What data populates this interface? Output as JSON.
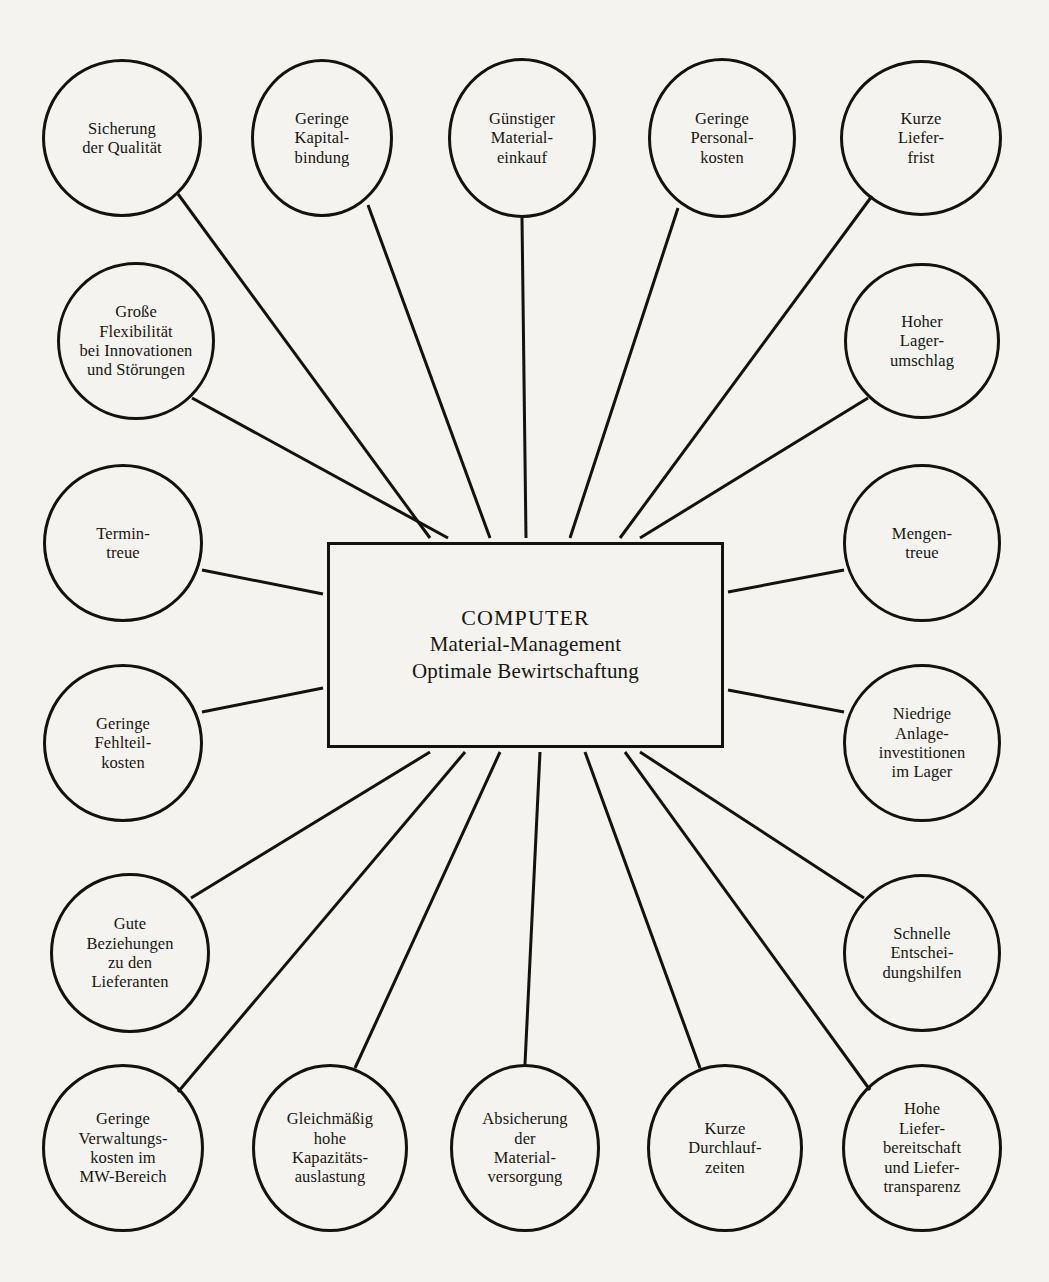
{
  "diagram": {
    "background_color": "#f4f3ef",
    "line_color": "#14120c",
    "center": {
      "title": "COMPUTER",
      "line2": "Material-Management",
      "line3": "Optimale Bewirtschaftung",
      "box": {
        "x": 327,
        "y": 542,
        "width": 397,
        "height": 206
      }
    },
    "nodes": [
      {
        "id": "sicherung-der-qualitaet",
        "label": "Sicherung\nder Qualität",
        "cx": 122,
        "cy": 138,
        "rx": 80,
        "ry": 79
      },
      {
        "id": "geringe-kapitalbindung",
        "label": "Geringe\nKapital-\nbindung",
        "cx": 322,
        "cy": 138,
        "rx": 71,
        "ry": 79
      },
      {
        "id": "guenstiger-materialeinkauf",
        "label": "Günstiger\nMaterial-\neinkauf",
        "cx": 522,
        "cy": 138,
        "rx": 74,
        "ry": 80
      },
      {
        "id": "geringe-personalkosten",
        "label": "Geringe\nPersonal-\nkosten",
        "cx": 722,
        "cy": 138,
        "rx": 74,
        "ry": 80
      },
      {
        "id": "kurze-lieferfrist",
        "label": "Kurze\nLiefer-\nfrist",
        "cx": 921,
        "cy": 138,
        "rx": 81,
        "ry": 78
      },
      {
        "id": "grosse-flexibilitaet",
        "label": "Große\nFlexibilität\nbei Innovationen\nund Störungen",
        "cx": 136,
        "cy": 341,
        "rx": 79,
        "ry": 79
      },
      {
        "id": "hoher-lagerumschlag",
        "label": "Hoher\nLager-\numschlag",
        "cx": 922,
        "cy": 341,
        "rx": 78,
        "ry": 78
      },
      {
        "id": "termintreue",
        "label": "Termin-\ntreue",
        "cx": 123,
        "cy": 543,
        "rx": 80,
        "ry": 79
      },
      {
        "id": "mengentreue",
        "label": "Mengen-\ntreue",
        "cx": 922,
        "cy": 543,
        "rx": 79,
        "ry": 79
      },
      {
        "id": "geringe-fehlteilkosten",
        "label": "Geringe\nFehlteil-\nkosten",
        "cx": 123,
        "cy": 743,
        "rx": 80,
        "ry": 79
      },
      {
        "id": "niedrige-anlageinvest",
        "label": "Niedrige\nAnlage-\ninvestitionen\nim Lager",
        "cx": 922,
        "cy": 743,
        "rx": 79,
        "ry": 79
      },
      {
        "id": "gute-beziehungen",
        "label": "Gute\nBeziehungen\nzu den\nLieferanten",
        "cx": 130,
        "cy": 953,
        "rx": 80,
        "ry": 80
      },
      {
        "id": "schnelle-entscheidungshilfen",
        "label": "Schnelle\nEntschei-\ndungshilfen",
        "cx": 922,
        "cy": 953,
        "rx": 79,
        "ry": 79
      },
      {
        "id": "geringe-verwaltungskosten",
        "label": "Geringe\nVerwaltungs-\nkosten im\nMW-Bereich",
        "cx": 123,
        "cy": 1148,
        "rx": 81,
        "ry": 84
      },
      {
        "id": "gleichmaessig-kapazitaet",
        "label": "Gleichmäßig\nhohe\nKapazitäts-\nauslastung",
        "cx": 330,
        "cy": 1148,
        "rx": 78,
        "ry": 84
      },
      {
        "id": "absicherung-materialversorgung",
        "label": "Absicherung\nder\nMaterial-\nversorgung",
        "cx": 525,
        "cy": 1148,
        "rx": 75,
        "ry": 84
      },
      {
        "id": "kurze-durchlaufzeiten",
        "label": "Kurze\nDurchlauf-\nzeiten",
        "cx": 725,
        "cy": 1148,
        "rx": 78,
        "ry": 84
      },
      {
        "id": "hohe-lieferbereitschaft",
        "label": "Hohe\nLiefer-\nbereitschaft\nund Liefer-\ntransparenz",
        "cx": 922,
        "cy": 1148,
        "rx": 80,
        "ry": 84
      }
    ],
    "connectors": [
      {
        "from": "sicherung-der-qualitaet",
        "x1": 178,
        "y1": 194,
        "x2": 430,
        "y2": 538
      },
      {
        "from": "geringe-kapitalbindung",
        "x1": 368,
        "y1": 205,
        "x2": 490,
        "y2": 538
      },
      {
        "from": "guenstiger-materialeinkauf",
        "x1": 522,
        "y1": 218,
        "x2": 526,
        "y2": 538
      },
      {
        "from": "geringe-personalkosten",
        "x1": 678,
        "y1": 208,
        "x2": 570,
        "y2": 538
      },
      {
        "from": "kurze-lieferfrist",
        "x1": 872,
        "y1": 196,
        "x2": 620,
        "y2": 538
      },
      {
        "from": "grosse-flexibilitaet",
        "x1": 192,
        "y1": 398,
        "x2": 448,
        "y2": 538
      },
      {
        "from": "hoher-lagerumschlag",
        "x1": 868,
        "y1": 398,
        "x2": 640,
        "y2": 538
      },
      {
        "from": "termintreue",
        "x1": 202,
        "y1": 570,
        "x2": 323,
        "y2": 594
      },
      {
        "from": "mengentreue",
        "x1": 844,
        "y1": 570,
        "x2": 728,
        "y2": 592
      },
      {
        "from": "geringe-fehlteilkosten",
        "x1": 202,
        "y1": 712,
        "x2": 323,
        "y2": 688
      },
      {
        "from": "niedrige-anlageinvest",
        "x1": 844,
        "y1": 712,
        "x2": 728,
        "y2": 690
      },
      {
        "from": "gute-beziehungen",
        "x1": 191,
        "y1": 898,
        "x2": 430,
        "y2": 752
      },
      {
        "from": "schnelle-entscheidungshilfen",
        "x1": 864,
        "y1": 898,
        "x2": 640,
        "y2": 752
      },
      {
        "from": "geringe-verwaltungskosten",
        "x1": 178,
        "y1": 1092,
        "x2": 465,
        "y2": 752
      },
      {
        "from": "gleichmaessig-kapazitaet",
        "x1": 355,
        "y1": 1068,
        "x2": 500,
        "y2": 752
      },
      {
        "from": "absicherung-materialversorgung",
        "x1": 525,
        "y1": 1064,
        "x2": 540,
        "y2": 752
      },
      {
        "from": "kurze-durchlaufzeiten",
        "x1": 700,
        "y1": 1068,
        "x2": 585,
        "y2": 752
      },
      {
        "from": "hohe-lieferbereitschaft",
        "x1": 870,
        "y1": 1090,
        "x2": 625,
        "y2": 752
      }
    ]
  }
}
